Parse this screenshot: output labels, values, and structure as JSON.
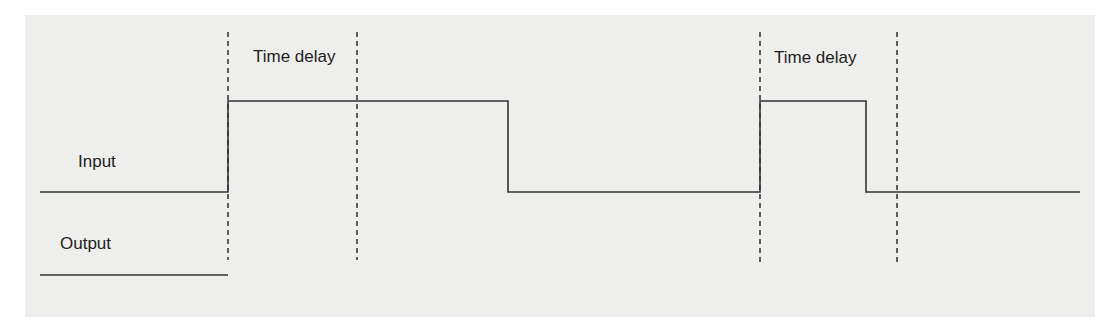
{
  "diagram": {
    "labels": {
      "input": "Input",
      "output": "Output",
      "time_delay_1": "Time delay",
      "time_delay_2": "Time delay"
    },
    "colors": {
      "background": "#ffffff",
      "paper": "#eeeeec",
      "line": "#333333",
      "text": "#1e1e1e"
    },
    "signals": {
      "input": {
        "name": "Input",
        "states": [
          {
            "from_x": 40,
            "to_x": 228,
            "level": "low"
          },
          {
            "from_x": 228,
            "to_x": 508,
            "level": "high"
          },
          {
            "from_x": 508,
            "to_x": 760,
            "level": "low"
          },
          {
            "from_x": 760,
            "to_x": 866,
            "level": "high"
          },
          {
            "from_x": 866,
            "to_x": 1080,
            "level": "low"
          }
        ]
      },
      "output": {
        "name": "Output",
        "states": [
          {
            "from_x": 40,
            "to_x": 228,
            "level": "low"
          }
        ]
      }
    },
    "time_delay_markers": [
      {
        "label": "Time delay",
        "start_x": 228,
        "end_x": 357
      },
      {
        "label": "Time delay",
        "start_x": 760,
        "end_x": 897
      }
    ]
  }
}
